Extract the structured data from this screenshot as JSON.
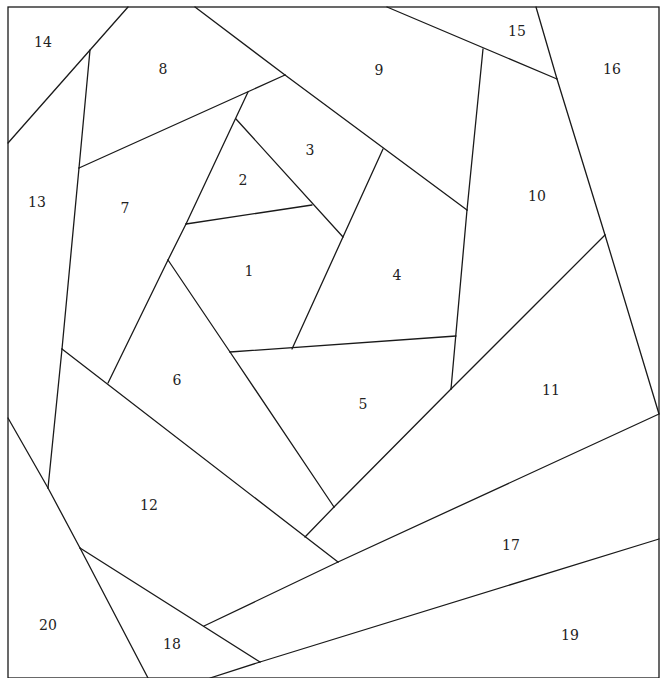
{
  "diagram": {
    "type": "crazy-quilt-block-template",
    "frame": {
      "x": 8,
      "y": 7,
      "width": 651,
      "height": 671
    },
    "line_color": "#1a1a1a",
    "background": "#ffffff",
    "segments": [
      [
        128,
        7,
        8,
        143
      ],
      [
        90,
        50,
        79,
        168
      ],
      [
        79,
        168,
        285,
        75
      ],
      [
        195,
        7,
        285,
        75
      ],
      [
        285,
        75,
        467,
        210
      ],
      [
        248,
        92,
        186,
        224
      ],
      [
        186,
        224,
        168,
        260
      ],
      [
        236,
        119,
        343,
        237
      ],
      [
        186,
        224,
        312,
        205
      ],
      [
        383,
        149,
        292,
        349
      ],
      [
        387,
        7,
        557,
        79
      ],
      [
        536,
        7,
        557,
        79
      ],
      [
        557,
        79,
        605,
        235
      ],
      [
        605,
        235,
        659,
        414
      ],
      [
        483,
        49,
        467,
        210
      ],
      [
        467,
        210,
        451,
        389
      ],
      [
        230,
        352,
        456,
        336
      ],
      [
        605,
        235,
        451,
        389
      ],
      [
        451,
        389,
        334,
        507
      ],
      [
        334,
        507,
        305,
        537
      ],
      [
        168,
        260,
        108,
        383
      ],
      [
        168,
        260,
        230,
        352
      ],
      [
        230,
        352,
        334,
        507
      ],
      [
        62,
        349,
        338,
        562
      ],
      [
        79,
        168,
        62,
        349
      ],
      [
        62,
        349,
        48,
        488
      ],
      [
        8,
        418,
        48,
        488
      ],
      [
        48,
        488,
        80,
        548
      ],
      [
        80,
        548,
        148,
        678
      ],
      [
        80,
        548,
        260,
        662
      ],
      [
        204,
        626,
        338,
        562
      ],
      [
        338,
        562,
        659,
        414
      ],
      [
        260,
        662,
        659,
        539
      ],
      [
        260,
        662,
        210,
        678
      ]
    ],
    "labels": [
      {
        "text": "1",
        "x": 249,
        "y": 272
      },
      {
        "text": "2",
        "x": 243,
        "y": 181
      },
      {
        "text": "3",
        "x": 310,
        "y": 151
      },
      {
        "text": "4",
        "x": 397,
        "y": 276
      },
      {
        "text": "5",
        "x": 363,
        "y": 405
      },
      {
        "text": "6",
        "x": 177,
        "y": 381
      },
      {
        "text": "7",
        "x": 125,
        "y": 209
      },
      {
        "text": "8",
        "x": 163,
        "y": 70
      },
      {
        "text": "9",
        "x": 379,
        "y": 71
      },
      {
        "text": "10",
        "x": 537,
        "y": 197
      },
      {
        "text": "11",
        "x": 551,
        "y": 391
      },
      {
        "text": "12",
        "x": 149,
        "y": 506
      },
      {
        "text": "13",
        "x": 37,
        "y": 203
      },
      {
        "text": "14",
        "x": 43,
        "y": 43
      },
      {
        "text": "15",
        "x": 517,
        "y": 32
      },
      {
        "text": "16",
        "x": 612,
        "y": 70
      },
      {
        "text": "17",
        "x": 511,
        "y": 546
      },
      {
        "text": "18",
        "x": 172,
        "y": 645
      },
      {
        "text": "19",
        "x": 570,
        "y": 636
      },
      {
        "text": "20",
        "x": 48,
        "y": 626
      }
    ]
  }
}
